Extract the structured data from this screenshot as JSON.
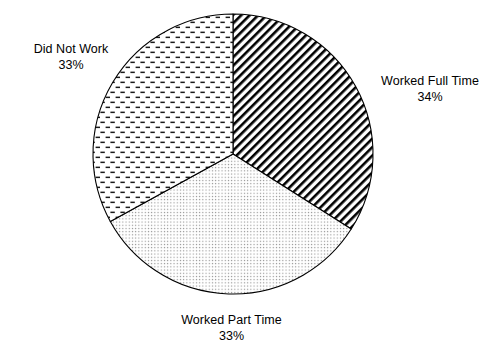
{
  "chart_data": {
    "type": "pie",
    "title": "",
    "subtitle": "",
    "xlabel": "",
    "ylabel": "",
    "legend_position": "none",
    "grid": false,
    "units": "percent",
    "start_angle_deg": 0,
    "direction": "clockwise",
    "categories": [
      "Worked Full Time",
      "Worked Part Time",
      "Did Not Work"
    ],
    "values": [
      34,
      33,
      33
    ],
    "slices": [
      {
        "label": "Worked Full Time",
        "value": 34,
        "value_text": "34%",
        "pattern": "diagonal-hatch",
        "fill": "#ffffff",
        "stroke": "#000000",
        "start_angle_deg": 0,
        "end_angle_deg": 122.4
      },
      {
        "label": "Worked Part Time",
        "value": 33,
        "value_text": "33%",
        "pattern": "fine-dots",
        "fill": "#ffffff",
        "stroke": "#000000",
        "start_angle_deg": 122.4,
        "end_angle_deg": 241.2
      },
      {
        "label": "Did Not Work",
        "value": 33,
        "value_text": "33%",
        "pattern": "horizontal-dashes",
        "fill": "#ffffff",
        "stroke": "#000000",
        "start_angle_deg": 241.2,
        "end_angle_deg": 360
      }
    ],
    "geometry": {
      "center_x": 233,
      "center_y": 154,
      "radius": 140
    },
    "colors": {
      "background": "#ffffff",
      "outline": "#000000",
      "text": "#000000"
    }
  },
  "labels": {
    "did_not_work": {
      "name": "Did Not Work",
      "value": "33%"
    },
    "worked_full_time": {
      "name": "Worked Full Time",
      "value": "34%"
    },
    "worked_part_time": {
      "name": "Worked Part Time",
      "value": "33%"
    }
  }
}
